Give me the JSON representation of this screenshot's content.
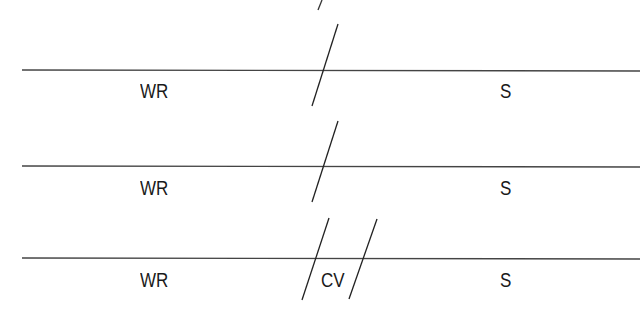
{
  "diagram": {
    "rows": [
      {
        "left_label": "WR",
        "right_label": "S",
        "divider_count": 1,
        "middle_label": ""
      },
      {
        "left_label": "WR",
        "right_label": "S",
        "divider_count": 1,
        "middle_label": ""
      },
      {
        "left_label": "WR",
        "right_label": "S",
        "divider_count": 2,
        "middle_label": "CV"
      }
    ],
    "colors": {
      "line": "#333333",
      "text": "#1a1a1a",
      "background": "#ffffff"
    }
  }
}
